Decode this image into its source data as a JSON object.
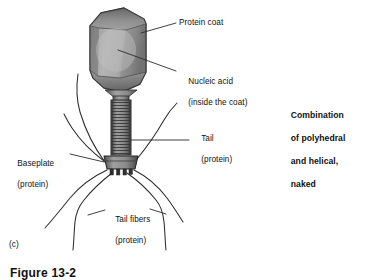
{
  "figure": {
    "panel_letter": "(c)",
    "caption": "Figure 13-2"
  },
  "labels": {
    "protein_coat": "Protein coat",
    "nucleic_acid_line1": "Nucleic acid",
    "nucleic_acid_line2": "(inside the coat)",
    "tail_line1": "Tail",
    "tail_line2": "(protein)",
    "baseplate_line1": "Baseplate",
    "baseplate_line2": "(protein)",
    "tail_fibers_line1": "Tail fibers",
    "tail_fibers_line2": "(protein)"
  },
  "note": {
    "line1": "Combination",
    "line2": "of polyhedral",
    "line3": "and helical,",
    "line4": "naked"
  },
  "colors": {
    "background": "#ffffff",
    "ink": "#111111",
    "outline": "#2b2b2b",
    "head_light": "#b9b9b9",
    "head_mid": "#9a9a9a",
    "head_dark": "#6e6e6e",
    "tail_gray": "#8e8e8e",
    "tail_stripe": "#3a3a3a",
    "baseplate": "#8a8a8a",
    "leader": "#2b2b2b",
    "fiber": "#2b2b2b"
  },
  "icons": {
    "head": "polyhedral-capsid-icon",
    "tail": "helical-tail-icon",
    "baseplate": "baseplate-icon",
    "fibers": "tail-fiber-icon"
  }
}
